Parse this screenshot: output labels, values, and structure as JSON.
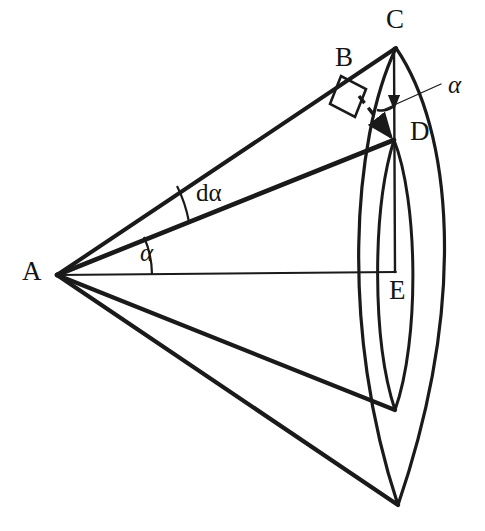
{
  "figure": {
    "background_color": "#ffffff",
    "stroke_color": "#1a1a1a",
    "thin_stroke_color": "#1a1a1a",
    "width": 485,
    "height": 531
  },
  "points": {
    "A": {
      "label": "A",
      "x": 57,
      "y": 275,
      "label_x": 22,
      "label_y": 258
    },
    "B": {
      "label": "B",
      "x": 352,
      "y": 90,
      "label_x": 335,
      "label_y": 44
    },
    "C": {
      "label": "C",
      "x": 396,
      "y": 48,
      "label_x": 386,
      "label_y": 6
    },
    "D": {
      "label": "D",
      "x": 394,
      "y": 140,
      "label_x": 410,
      "label_y": 118
    },
    "E": {
      "label": "E",
      "x": 395,
      "y": 272,
      "label_x": 389,
      "label_y": 277
    },
    "F_inner_bottom": {
      "label": "",
      "x": 395,
      "y": 410
    },
    "G_outer_bottom": {
      "label": "",
      "x": 398,
      "y": 505
    }
  },
  "angles": {
    "alpha_at_A": {
      "label": "α",
      "label_x": 140,
      "label_y": 240,
      "arc_radius": 95
    },
    "d_alpha_at_A": {
      "label_prefix": "d",
      "label_symbol": "α",
      "label_text": "dα",
      "label_x": 196,
      "label_y": 180,
      "arc_radius": 135
    },
    "alpha_at_C": {
      "label": "α",
      "label_x": 448,
      "label_y": 72,
      "leader_from_x": 441,
      "leader_from_y": 92,
      "leader_to_x": 390,
      "leader_to_y": 108
    }
  },
  "markers": {
    "right_angle_at_B": {
      "name": "right-angle-square",
      "description": "small square marking perpendicular at B"
    },
    "dashed_segment_BD": {
      "name": "dashed-perpendicular-B-to-D",
      "description": "dashed line with arrowhead from B down to D"
    }
  },
  "elements": {
    "ray_AC_label": "ray A to C",
    "ray_AD_label": "ray A to D",
    "ray_AE_label": "ray A to E (axis)",
    "ray_A_inner_label": "ray A to inner lens bottom",
    "ray_A_outer_label": "ray A to outer lens bottom",
    "chord_CE_label": "vertical chord C to E",
    "arc_outer_label": "outer spherical arc",
    "arc_inner_label": "inner spherical arc"
  }
}
